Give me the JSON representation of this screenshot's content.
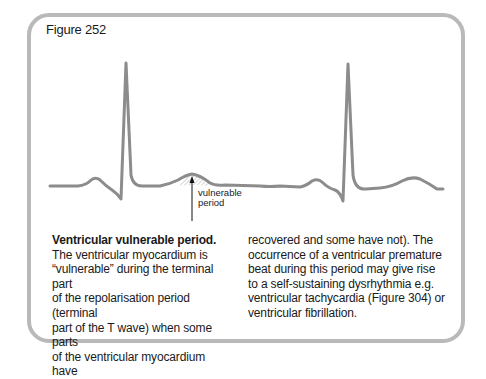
{
  "figure": {
    "label": "Figure 252",
    "annotation": {
      "line1": "vulnerable",
      "line2": "period"
    }
  },
  "caption": {
    "heading": "Ventricular vulnerable period.",
    "left_lines": [
      "The ventricular myocardium is",
      "“vulnerable” during the terminal part",
      "of the repolarisation period (terminal",
      "part of the T wave) when some parts",
      "of the ventricular myocardium have"
    ],
    "right_lines": [
      "recovered and some have not). The",
      "occurrence of a ventricular premature",
      "beat during this period may give rise",
      "to a self-sustaining dysrhythmia e.g.",
      "ventricular tachycardia (Figure 304) or",
      "ventricular fibrillation."
    ]
  },
  "colors": {
    "frame": "#b9b9b9",
    "trace": "#8c8c8c",
    "text": "#1a1a1a"
  }
}
